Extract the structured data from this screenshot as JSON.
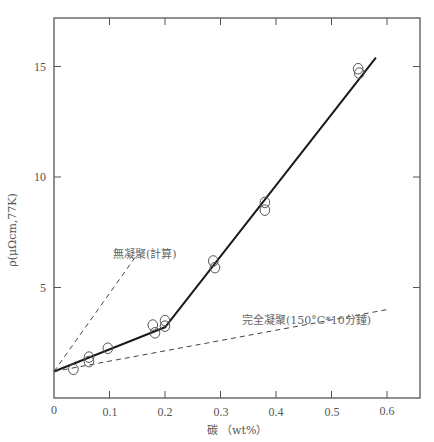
{
  "chart_data": {
    "type": "scatter",
    "title": "",
    "xlabel": "碳 （wt%）",
    "ylabel": "ρ(μΩcm,77K)",
    "xlim": [
      0,
      0.65
    ],
    "ylim": [
      0,
      17
    ],
    "xticks": [
      0,
      0.1,
      0.2,
      0.3,
      0.4,
      0.5,
      0.6
    ],
    "xtick_labels": [
      "0",
      "0.1",
      "0.2",
      "0.3",
      "0.4",
      "0.5",
      "0.6"
    ],
    "yticks": [
      5,
      10,
      15
    ],
    "ytick_labels": [
      "5",
      "10",
      "15"
    ],
    "grid": false,
    "legend": null,
    "series": [
      {
        "name": "measured",
        "kind": "scatter",
        "marker": "open-circle",
        "x": [
          0.035,
          0.063,
          0.063,
          0.097,
          0.178,
          0.182,
          0.2,
          0.2,
          0.287,
          0.29,
          0.38,
          0.38,
          0.548,
          0.55
        ],
        "y": [
          1.3,
          1.85,
          1.65,
          2.25,
          3.3,
          2.95,
          3.5,
          3.25,
          6.2,
          5.9,
          8.85,
          8.5,
          14.9,
          14.7
        ]
      },
      {
        "name": "fit",
        "kind": "line",
        "style": "solid",
        "x": [
          0,
          0.2,
          0.58
        ],
        "y": [
          1.2,
          3.2,
          15.4
        ]
      },
      {
        "name": "完全凝聚(150°C*10分鐘)",
        "kind": "line",
        "style": "dashed",
        "x": [
          0,
          0.6
        ],
        "y": [
          1.2,
          4.0
        ]
      },
      {
        "name": "無凝聚(計算)",
        "kind": "line",
        "style": "dashed",
        "x": [
          0,
          0.15
        ],
        "y": [
          1.2,
          6.5
        ]
      }
    ],
    "annotations": [
      {
        "text": "無凝聚(計算)",
        "x": 0.115,
        "y": 6.7
      },
      {
        "text": "完全凝聚(150°C*10分鐘)",
        "x": 0.305,
        "y": 3.95
      }
    ]
  },
  "labels": {
    "x_axis": "碳 （wt%）",
    "y_axis": "ρ(μΩcm,77K)",
    "annot_no_precip": "無凝聚(計算)",
    "annot_full_precip": "完全凝聚(150°C*10分鐘)",
    "xtick_0": "0",
    "xtick_1": "0.1",
    "xtick_2": "0.2",
    "xtick_3": "0.3",
    "xtick_4": "0.4",
    "xtick_5": "0.5",
    "xtick_6": "0.6",
    "ytick_5": "5",
    "ytick_10": "10",
    "ytick_15": "15"
  },
  "colors": {
    "axis": "#555555",
    "line": "#1a1a1a",
    "dashed": "#444444",
    "marker": "#555555"
  }
}
